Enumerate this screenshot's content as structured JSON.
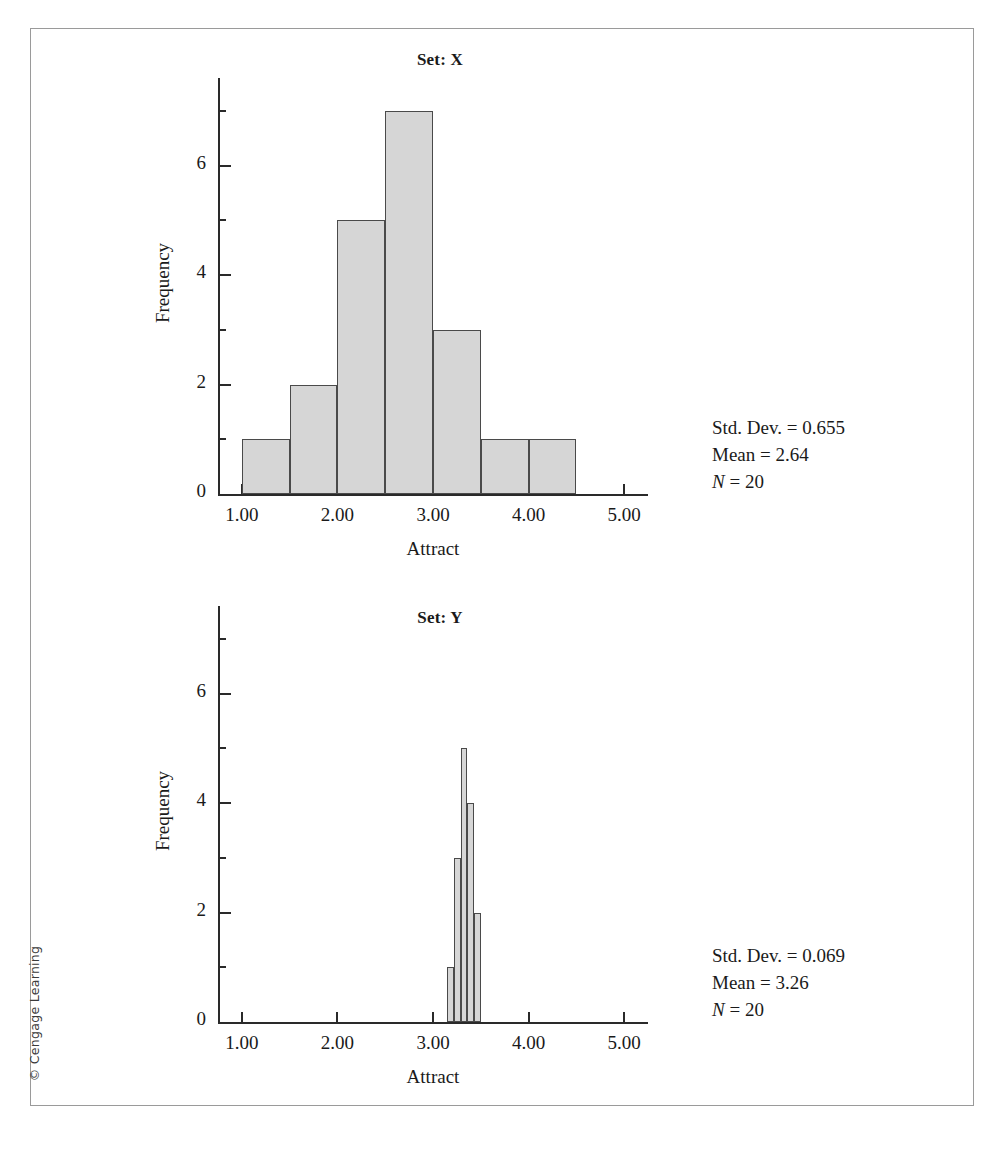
{
  "figure": {
    "copyright": "© Cengage Learning",
    "bar_fill": "#d6d6d6",
    "bar_stroke": "#4a4a4a",
    "axis_color": "#2a2a2a"
  },
  "chart_data": [
    {
      "type": "bar",
      "title": "Set: X",
      "xlabel": "Attract",
      "ylabel": "Frequency",
      "xlim": [
        0.75,
        5.25
      ],
      "ylim": [
        0,
        7.6
      ],
      "xticks": [
        1.0,
        2.0,
        3.0,
        4.0,
        5.0
      ],
      "xtick_labels": [
        "1.00",
        "2.00",
        "3.00",
        "4.00",
        "5.00"
      ],
      "yticks": [
        0,
        2,
        4,
        6
      ],
      "ytick_labels": [
        "0",
        "2",
        "4",
        "6"
      ],
      "minor_yticks": [
        1,
        3,
        5,
        7
      ],
      "grid": false,
      "legend": "none",
      "bin_width": 0.5,
      "bins": [
        {
          "start": 1.0,
          "end": 1.5,
          "value": 1
        },
        {
          "start": 1.5,
          "end": 2.0,
          "value": 2
        },
        {
          "start": 2.0,
          "end": 2.5,
          "value": 5
        },
        {
          "start": 2.5,
          "end": 3.0,
          "value": 7
        },
        {
          "start": 3.0,
          "end": 3.5,
          "value": 3
        },
        {
          "start": 3.5,
          "end": 4.0,
          "value": 1
        },
        {
          "start": 4.0,
          "end": 4.5,
          "value": 1
        }
      ],
      "annotations": {
        "std_dev": "Std. Dev. = 0.655",
        "mean": "Mean = 2.64",
        "n_symbol": "N",
        "n_value": " = 20"
      }
    },
    {
      "type": "bar",
      "title": "Set: Y",
      "xlabel": "Attract",
      "ylabel": "Frequency",
      "xlim": [
        0.75,
        5.25
      ],
      "ylim": [
        0,
        7.6
      ],
      "xticks": [
        1.0,
        2.0,
        3.0,
        4.0,
        5.0
      ],
      "xtick_labels": [
        "1.00",
        "2.00",
        "3.00",
        "4.00",
        "5.00"
      ],
      "yticks": [
        0,
        2,
        4,
        6
      ],
      "ytick_labels": [
        "0",
        "2",
        "4",
        "6"
      ],
      "minor_yticks": [
        1,
        3,
        5,
        7
      ],
      "grid": false,
      "legend": "none",
      "bin_width": 0.07,
      "bins": [
        {
          "start": 3.15,
          "end": 3.22,
          "value": 1
        },
        {
          "start": 3.22,
          "end": 3.29,
          "value": 3
        },
        {
          "start": 3.29,
          "end": 3.36,
          "value": 5
        },
        {
          "start": 3.36,
          "end": 3.43,
          "value": 4
        },
        {
          "start": 3.43,
          "end": 3.5,
          "value": 2
        }
      ],
      "annotations": {
        "std_dev": "Std. Dev. = 0.069",
        "mean": "Mean = 3.26",
        "n_symbol": "N",
        "n_value": " = 20"
      }
    }
  ]
}
